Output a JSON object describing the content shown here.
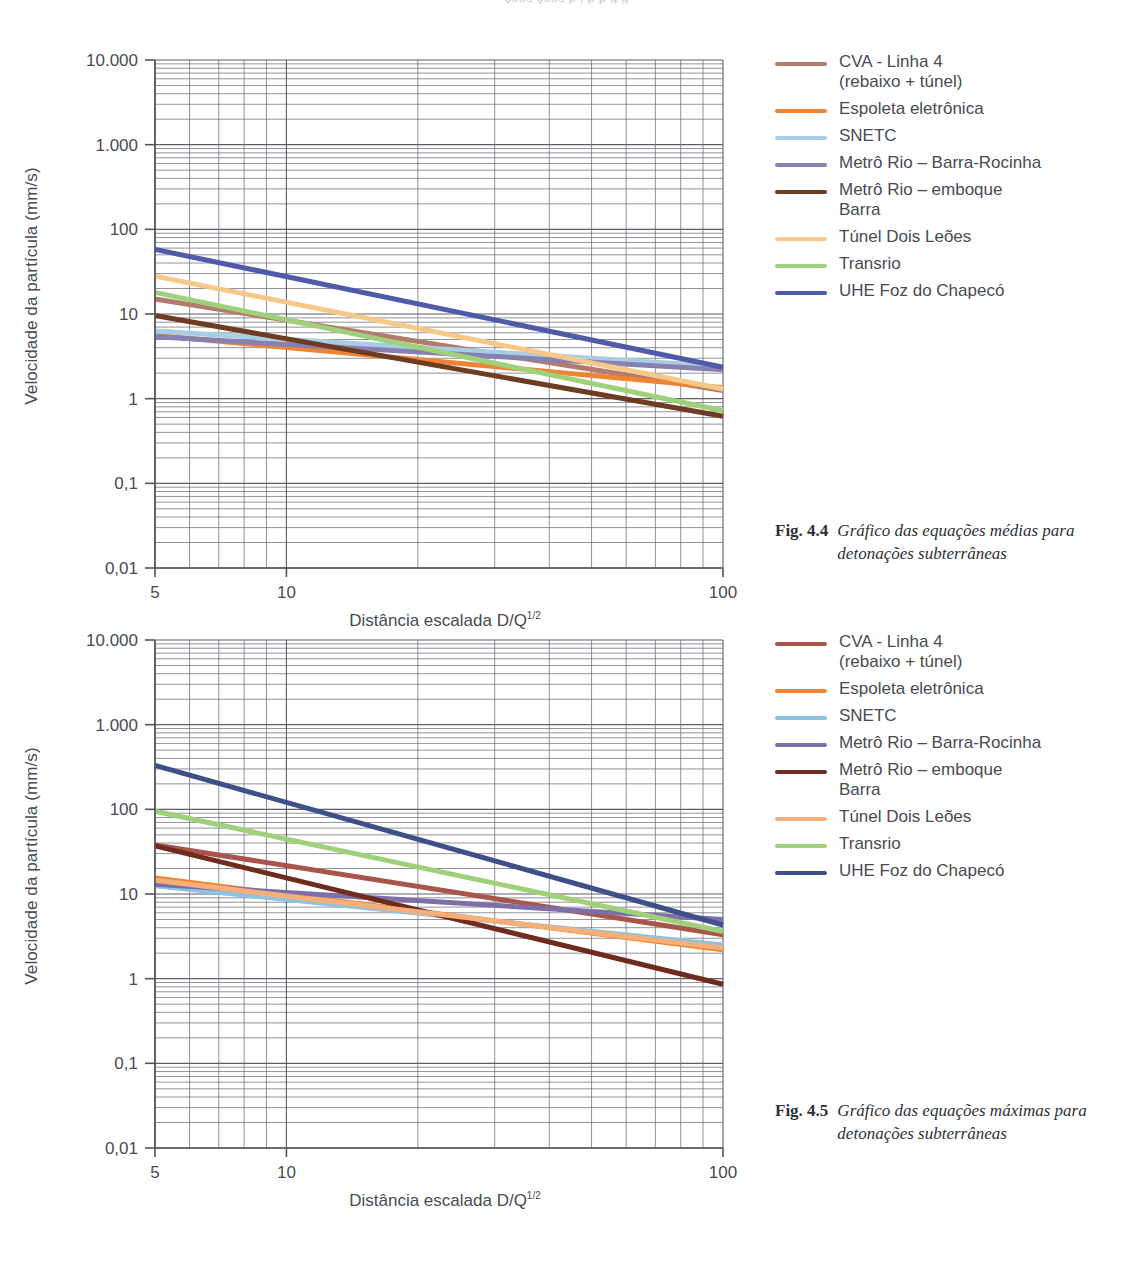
{
  "page": {
    "top_cut_text": "ções    ções   p            , p  p           g     g"
  },
  "figures": [
    {
      "id": "fig-4-4",
      "caption_number": "Fig. 4.4",
      "caption_text": "Gráfico das equações médias para detonações subterrâneas",
      "chart_data": {
        "type": "line",
        "title": "",
        "xlabel": "Distância escalada D/Q",
        "xlabel_sup": "1/2",
        "ylabel": "Velocidade da partícula (mm/s)",
        "scale": "log-log",
        "xlim": [
          5,
          100
        ],
        "ylim": [
          0.01,
          10000
        ],
        "xticks": [
          5,
          10,
          100
        ],
        "xtick_labels": [
          "5",
          "10",
          "100"
        ],
        "yticks": [
          0.01,
          0.1,
          1,
          10,
          100,
          1000,
          10000
        ],
        "ytick_labels": [
          "0,01",
          "0,1",
          "1",
          "10",
          "100",
          "1.000",
          "10.000"
        ],
        "grid": true,
        "legend_position": "right",
        "series": [
          {
            "name": "CVA - Linha 4\n(rebaixo + túnel)",
            "color": "#b57a6e",
            "x": [
              5,
              100
            ],
            "y": [
              15.0,
              1.25
            ]
          },
          {
            "name": "Espoleta eletrônica",
            "color": "#ee8434",
            "x": [
              5,
              100
            ],
            "y": [
              5.6,
              1.35
            ]
          },
          {
            "name": "SNETC",
            "color": "#a8cee4",
            "x": [
              5,
              100
            ],
            "y": [
              6.3,
              2.4
            ]
          },
          {
            "name": "Metrô Rio – Barra-Rocinha",
            "color": "#8880b0",
            "x": [
              5,
              100
            ],
            "y": [
              5.4,
              2.2
            ]
          },
          {
            "name": "Metrô Rio – emboque\nBarra",
            "color": "#6e3b23",
            "x": [
              5,
              100
            ],
            "y": [
              9.6,
              0.62
            ]
          },
          {
            "name": "Túnel Dois Leões",
            "color": "#f8c889",
            "x": [
              5,
              100
            ],
            "y": [
              28.0,
              1.3
            ]
          },
          {
            "name": "Transrio",
            "color": "#9fd07a",
            "x": [
              5,
              100
            ],
            "y": [
              18.0,
              0.72
            ]
          },
          {
            "name": "UHE Foz do Chapecó",
            "color": "#4f5aa8",
            "x": [
              5,
              100
            ],
            "y": [
              58.0,
              2.35
            ]
          }
        ]
      }
    },
    {
      "id": "fig-4-5",
      "caption_number": "Fig. 4.5",
      "caption_text": "Gráfico das equações máximas para detonações subterrâneas",
      "chart_data": {
        "type": "line",
        "title": "",
        "xlabel": "Distância escalada D/Q",
        "xlabel_sup": "1/2",
        "ylabel": "Velocidade da partícula (mm/s)",
        "scale": "log-log",
        "xlim": [
          5,
          100
        ],
        "ylim": [
          0.01,
          10000
        ],
        "xticks": [
          5,
          10,
          100
        ],
        "xtick_labels": [
          "5",
          "10",
          "100"
        ],
        "yticks": [
          0.01,
          0.1,
          1,
          10,
          100,
          1000,
          10000
        ],
        "ytick_labels": [
          "0,01",
          "0,1",
          "1",
          "10",
          "100",
          "1.000",
          "10.000"
        ],
        "grid": true,
        "legend_position": "right",
        "series": [
          {
            "name": "CVA - Linha 4\n(rebaixo + túnel)",
            "color": "#a8564b",
            "x": [
              5,
              100
            ],
            "y": [
              38.0,
              3.3
            ]
          },
          {
            "name": "Espoleta eletrônica",
            "color": "#ee8434",
            "x": [
              5,
              100
            ],
            "y": [
              15.5,
              2.2
            ]
          },
          {
            "name": "SNETC",
            "color": "#8cc2e2",
            "x": [
              5,
              100
            ],
            "y": [
              12.5,
              2.5
            ]
          },
          {
            "name": "Metrô Rio – Barra-Rocinha",
            "color": "#7e6fa8",
            "x": [
              5,
              100
            ],
            "y": [
              13.0,
              5.0
            ]
          },
          {
            "name": "Metrô Rio – emboque\nBarra",
            "color": "#6e2b1e",
            "x": [
              5,
              100
            ],
            "y": [
              37.0,
              0.86
            ]
          },
          {
            "name": "Túnel Dois Leões",
            "color": "#f5b07a",
            "x": [
              5,
              100
            ],
            "y": [
              14.5,
              2.3
            ]
          },
          {
            "name": "Transrio",
            "color": "#9fd07a",
            "x": [
              5,
              100
            ],
            "y": [
              95.0,
              3.6
            ]
          },
          {
            "name": "UHE Foz do Chapecó",
            "color": "#3f4f88",
            "x": [
              5,
              100
            ],
            "y": [
              330.0,
              4.3
            ]
          }
        ]
      }
    }
  ],
  "legend_extra": {
    "uhe_blue_chart2": "#6b84cc"
  }
}
